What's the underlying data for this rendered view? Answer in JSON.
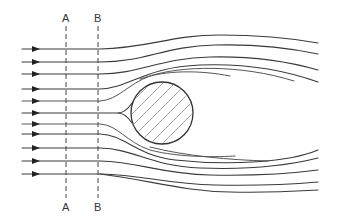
{
  "diagram": {
    "sections": [
      {
        "id": "A",
        "x": 66,
        "top_label": "A",
        "bottom_label": "A"
      },
      {
        "id": "B",
        "x": 98,
        "top_label": "B",
        "bottom_label": "B"
      }
    ],
    "obstacle": {
      "shape": "circle",
      "cx": 162,
      "cy": 113,
      "r": 31,
      "fill": "hatched"
    },
    "inflow_arrows_y": [
      49,
      62,
      74,
      89,
      101,
      113,
      124,
      134,
      148,
      161,
      174
    ],
    "colors": {
      "line": "#3a3a3a",
      "hatch": "#888888",
      "background": "#ffffff"
    }
  }
}
